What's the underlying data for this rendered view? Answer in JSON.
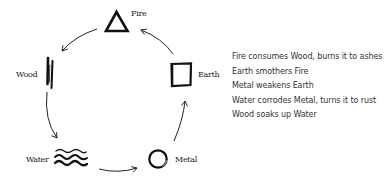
{
  "diagram": {
    "type": "cycle",
    "elements": [
      {
        "id": "fire",
        "label": "Fire",
        "symbol": "triangle-icon"
      },
      {
        "id": "earth",
        "label": "Earth",
        "symbol": "square-icon"
      },
      {
        "id": "metal",
        "label": "Metal",
        "symbol": "circle-icon"
      },
      {
        "id": "water",
        "label": "Water",
        "symbol": "waves-icon"
      },
      {
        "id": "wood",
        "label": "Wood",
        "symbol": "vertical-strokes-icon"
      }
    ],
    "arrows": [
      {
        "from": "Fire",
        "to": "Wood"
      },
      {
        "from": "Wood",
        "to": "Water"
      },
      {
        "from": "Water",
        "to": "Metal"
      },
      {
        "from": "Metal",
        "to": "Earth"
      },
      {
        "from": "Earth",
        "to": "Fire"
      }
    ]
  },
  "relations": [
    "Fire consumes Wood, burns it to ashes",
    "Earth smothers Fire",
    "Metal weakens Earth",
    "Water corrodes Metal, turns it to rust",
    "Wood soaks up Water"
  ],
  "colors": {
    "ink": "#111111",
    "text": "#333333",
    "background": "#ffffff"
  }
}
